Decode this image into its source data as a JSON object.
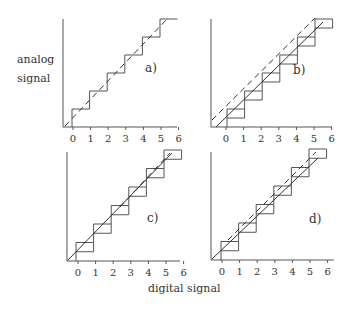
{
  "figure": {
    "y_axis_label_line1": "analog",
    "y_axis_label_line2": "signal",
    "x_axis_label": "digital signal",
    "tick_labels": [
      "0",
      "1",
      "2",
      "3",
      "4",
      "5",
      "6"
    ]
  },
  "panels": [
    {
      "label": "a)",
      "origin": [
        63,
        127
      ],
      "axis_top": 19,
      "axis_right": 177,
      "tick0_x": 73,
      "tick_step": 17.6,
      "step_h": 18,
      "label_pos": [
        145,
        72
      ],
      "stair_style": "plain",
      "stair_start": [
        72,
        127
      ],
      "steps": 6,
      "solid_line": null,
      "dashed_line": [
        [
          65,
          126
        ],
        [
          168,
          18
        ]
      ]
    },
    {
      "label": "b)",
      "origin": [
        211,
        127
      ],
      "axis_top": 19,
      "axis_right": 332,
      "tick0_x": 226,
      "tick_step": 17.6,
      "step_h": 18,
      "label_pos": [
        293,
        74
      ],
      "stair_style": "notched",
      "stair_start": [
        227,
        127
      ],
      "steps": 6,
      "solid_line": [
        [
          216,
          127
        ],
        [
          323,
          22
        ]
      ],
      "dashed_line": [
        [
          212,
          120
        ],
        [
          315,
          18
        ]
      ]
    },
    {
      "label": "c)",
      "origin": [
        67,
        261
      ],
      "axis_top": 152,
      "axis_right": 180,
      "tick0_x": 78,
      "tick_step": 17.6,
      "step_h": 18.5,
      "label_pos": [
        147,
        222
      ],
      "stair_style": "notched",
      "stair_start": [
        76,
        261
      ],
      "steps": 6,
      "solid_line": [
        [
          68,
          260
        ],
        [
          172,
          153
        ]
      ],
      "dashed_line": [
        [
          120,
          207
        ],
        [
          170,
          153
        ]
      ]
    },
    {
      "label": "d)",
      "origin": [
        211,
        260
      ],
      "axis_top": 152,
      "axis_right": 334,
      "tick0_x": 222,
      "tick_step": 17.6,
      "step_h": 18.5,
      "label_pos": [
        309,
        223
      ],
      "stair_style": "notched",
      "stair_start": [
        221,
        260
      ],
      "steps": 6,
      "solid_line": [
        [
          212,
          259
        ],
        [
          318,
          158
        ]
      ],
      "dashed_line": [
        [
          228,
          240
        ],
        [
          316,
          152
        ]
      ]
    }
  ]
}
